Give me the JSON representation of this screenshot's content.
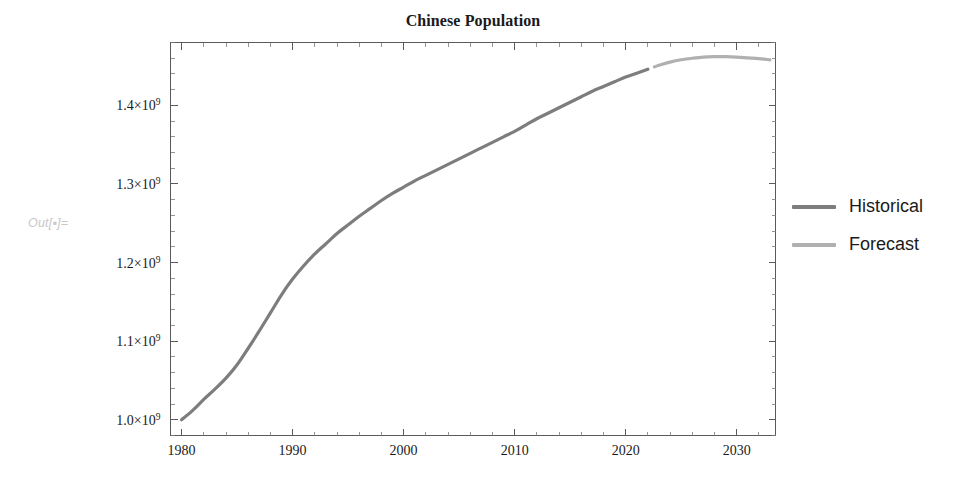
{
  "out_prompt": "Out[▪]=",
  "legend": {
    "position": "right",
    "entries": [
      {
        "label": "Historical",
        "color": "#7d7d7d"
      },
      {
        "label": "Forecast",
        "color": "#b0b0b0"
      }
    ]
  },
  "chart_data": {
    "type": "line",
    "title": "Chinese Population",
    "xlabel": "",
    "ylabel": "",
    "xlim": [
      1979,
      2033.5
    ],
    "ylim": [
      980000000,
      1480000000
    ],
    "grid": false,
    "frame": true,
    "y_tick_labels": [
      "1.0×10⁹",
      "1.1×10⁹",
      "1.2×10⁹",
      "1.3×10⁹",
      "1.4×10⁹"
    ],
    "y_ticks": [
      1000000000,
      1100000000,
      1200000000,
      1300000000,
      1400000000
    ],
    "y_minor_per_major": 5,
    "x_tick_labels": [
      "1980",
      "1990",
      "2000",
      "2010",
      "2020",
      "2030"
    ],
    "x_ticks": [
      1980,
      1990,
      2000,
      2010,
      2020,
      2030
    ],
    "x_minor_per_major": 5,
    "series": [
      {
        "name": "Historical",
        "color": "#7d7d7d",
        "x": [
          1980,
          1981,
          1982,
          1983,
          1984,
          1985,
          1986,
          1987,
          1988,
          1989,
          1990,
          1991,
          1992,
          1993,
          1994,
          1995,
          1996,
          1997,
          1998,
          1999,
          2000,
          2001,
          2002,
          2003,
          2004,
          2005,
          2006,
          2007,
          2008,
          2009,
          2010,
          2011,
          2012,
          2013,
          2014,
          2015,
          2016,
          2017,
          2018,
          2019,
          2020,
          2021,
          2022
        ],
        "values": [
          1000000000,
          1012000000,
          1026000000,
          1039000000,
          1053000000,
          1070000000,
          1091000000,
          1113000000,
          1136000000,
          1159000000,
          1179000000,
          1196000000,
          1211000000,
          1224000000,
          1237000000,
          1248000000,
          1259000000,
          1269000000,
          1279000000,
          1288000000,
          1296000000,
          1304000000,
          1311000000,
          1318000000,
          1325000000,
          1332000000,
          1339000000,
          1346000000,
          1353000000,
          1360000000,
          1367000000,
          1375000000,
          1383000000,
          1390000000,
          1397000000,
          1404000000,
          1411000000,
          1418000000,
          1424000000,
          1430000000,
          1436000000,
          1441000000,
          1446000000
        ]
      },
      {
        "name": "Forecast",
        "color": "#b0b0b0",
        "x": [
          2022.6,
          2023,
          2024,
          2025,
          2026,
          2027,
          2028,
          2029,
          2030,
          2031,
          2032,
          2033
        ],
        "values": [
          1449000000,
          1451000000,
          1455000000,
          1458000000,
          1460000000,
          1461500000,
          1462000000,
          1462000000,
          1461500000,
          1460500000,
          1459500000,
          1458000000
        ]
      }
    ]
  }
}
